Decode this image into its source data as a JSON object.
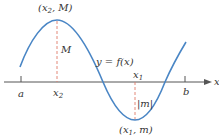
{
  "figure": {
    "colors": {
      "curve": "#4a86c5",
      "axis": "#555555",
      "dashed": "#e07a6a",
      "text": "#333333"
    },
    "curve_label": "y = f(x)",
    "axis_label": "x",
    "ticks": [
      {
        "label": "a",
        "x": 21
      },
      {
        "label": "b",
        "x": 185
      }
    ],
    "max_point": {
      "label_open": "(x",
      "label_sub": "2",
      "label_close": ", M)",
      "x_label": "x",
      "x_sub": "2",
      "height_label": "M"
    },
    "min_point": {
      "label_open": "(x",
      "label_sub": "1",
      "label_close": ", m)",
      "x_label": "x",
      "x_sub": "1",
      "height_label": "|m|"
    }
  }
}
